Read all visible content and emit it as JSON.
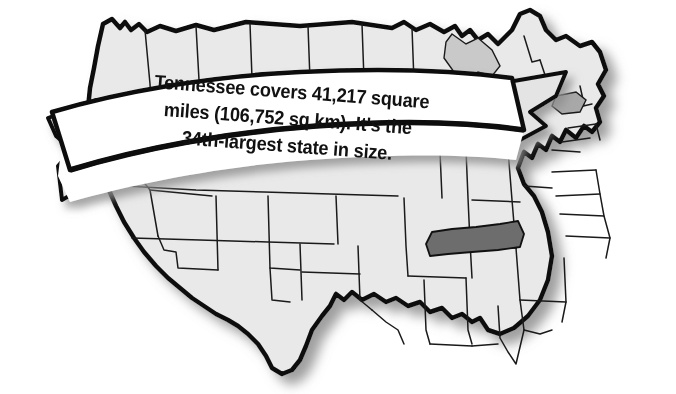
{
  "image": {
    "kind": "illustrated-map-with-banner",
    "subject": "United States map with Tennessee highlighted",
    "background_color": "#ffffff"
  },
  "map": {
    "name": "united-states-map",
    "state_fill": "#e9e9e9",
    "state_border_color": "#1a1a1a",
    "outline_color": "#111111",
    "shadow_color": "#9a9a9a",
    "highlight": {
      "state": "Tennessee",
      "fill": "#6d6d6d",
      "border": "#111111"
    },
    "secondary_highlight": {
      "state": "Tennessee-sliver-under-banner",
      "fill": "#a8a8a8"
    }
  },
  "banner": {
    "name": "ribbon-banner",
    "fill": "#ffffff",
    "edge_color": "#111111",
    "fold_fill": "#e4e4e4",
    "lines": [
      "Tennessee covers 41,217 square",
      "miles (106,752 sq km). It's the",
      "34th-largest state in size."
    ],
    "full_text": "Tennessee covers 41,217 square miles (106,752 sq km). It's the 34th-largest state in size.",
    "facts": {
      "state": "Tennessee",
      "area_square_miles": "41,217",
      "area_square_kilometers": "106,752",
      "size_rank": "34th-largest"
    }
  }
}
